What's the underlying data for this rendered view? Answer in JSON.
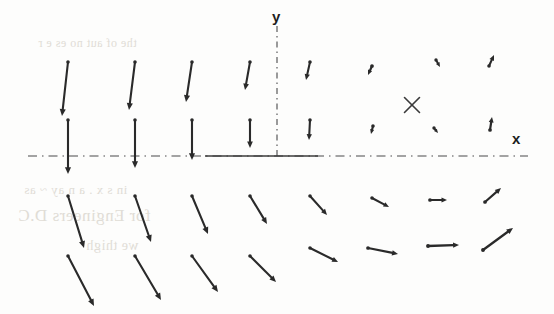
{
  "figure": {
    "kind": "vector-field-plot",
    "width": 554,
    "height": 314,
    "background_color": "#fdfdfc",
    "stroke_color": "#2a2a2a"
  },
  "axes": {
    "x_label": "x",
    "y_label": "y",
    "style": "dash-dot",
    "color": "#4a4a4a",
    "origin_px": {
      "x": 277,
      "y": 156
    },
    "x_axis_y_px": 156,
    "y_axis_x_px": 277,
    "x_axis_start_px": 28,
    "x_axis_end_px": 528,
    "y_axis_top_px": 26,
    "y_axis_bottom_px": 156,
    "x_label_pos_px": {
      "x": 512,
      "y": 144
    },
    "y_label_pos_px": {
      "x": 272,
      "y": 22
    },
    "solid_segment": {
      "x1": 205,
      "x2": 318,
      "y": 156
    }
  },
  "marker": {
    "name": "saddle-point-cross",
    "glyph": "X",
    "pos_px": {
      "x": 412,
      "y": 105
    },
    "size_px": 15,
    "stroke_width": 1.6,
    "color": "#3a3a3a"
  },
  "chart_data": {
    "type": "scatter",
    "title": "",
    "xlabel": "x",
    "ylabel": "y",
    "grid": false,
    "legend": null,
    "columns_px": [
      68,
      135,
      192,
      250,
      310,
      372,
      432,
      492
    ],
    "rows_px": [
      62,
      120,
      196,
      256
    ],
    "vectors": [
      {
        "x": 68,
        "y": 62,
        "dx": -6,
        "dy": 54,
        "head": 7.5,
        "width": 2.1
      },
      {
        "x": 135,
        "y": 62,
        "dx": -6,
        "dy": 48,
        "head": 7.5,
        "width": 2.1
      },
      {
        "x": 192,
        "y": 62,
        "dx": -6,
        "dy": 40,
        "head": 7.5,
        "width": 2.1
      },
      {
        "x": 250,
        "y": 62,
        "dx": -5,
        "dy": 28,
        "head": 7.0,
        "width": 2.1
      },
      {
        "x": 310,
        "y": 62,
        "dx": -4,
        "dy": 18,
        "head": 6.5,
        "width": 2.1
      },
      {
        "x": 372,
        "y": 66,
        "dx": -4,
        "dy": 9,
        "head": 5.5,
        "width": 2.2
      },
      {
        "x": 436,
        "y": 60,
        "dx": 4,
        "dy": 7,
        "head": 5.0,
        "width": 2.0
      },
      {
        "x": 489,
        "y": 66,
        "dx": 5,
        "dy": -11,
        "head": 6.0,
        "width": 2.1
      },
      {
        "x": 68,
        "y": 120,
        "dx": 0,
        "dy": 54,
        "head": 7.5,
        "width": 2.1
      },
      {
        "x": 135,
        "y": 120,
        "dx": 0,
        "dy": 48,
        "head": 7.5,
        "width": 2.1
      },
      {
        "x": 192,
        "y": 120,
        "dx": 0,
        "dy": 40,
        "head": 7.5,
        "width": 2.1
      },
      {
        "x": 250,
        "y": 120,
        "dx": 0,
        "dy": 28,
        "head": 7.0,
        "width": 2.1
      },
      {
        "x": 310,
        "y": 120,
        "dx": -1,
        "dy": 20,
        "head": 6.5,
        "width": 2.1
      },
      {
        "x": 373,
        "y": 126,
        "dx": -2,
        "dy": 8,
        "head": 5.0,
        "width": 2.1
      },
      {
        "x": 434,
        "y": 128,
        "dx": 4,
        "dy": 5,
        "head": 4.5,
        "width": 2.0
      },
      {
        "x": 490,
        "y": 130,
        "dx": 2,
        "dy": -13,
        "head": 6.0,
        "width": 2.2
      },
      {
        "x": 68,
        "y": 196,
        "dx": 16,
        "dy": 52,
        "head": 7.5,
        "width": 2.1
      },
      {
        "x": 135,
        "y": 196,
        "dx": 16,
        "dy": 46,
        "head": 7.5,
        "width": 2.1
      },
      {
        "x": 192,
        "y": 196,
        "dx": 16,
        "dy": 38,
        "head": 7.5,
        "width": 2.1
      },
      {
        "x": 250,
        "y": 196,
        "dx": 17,
        "dy": 28,
        "head": 7.0,
        "width": 2.1
      },
      {
        "x": 310,
        "y": 196,
        "dx": 17,
        "dy": 19,
        "head": 6.5,
        "width": 2.1
      },
      {
        "x": 372,
        "y": 198,
        "dx": 17,
        "dy": 9,
        "head": 6.0,
        "width": 2.1
      },
      {
        "x": 430,
        "y": 200,
        "dx": 17,
        "dy": 0,
        "head": 6.0,
        "width": 2.2
      },
      {
        "x": 485,
        "y": 202,
        "dx": 16,
        "dy": -14,
        "head": 6.5,
        "width": 2.2
      },
      {
        "x": 68,
        "y": 256,
        "dx": 26,
        "dy": 50,
        "head": 7.5,
        "width": 2.1
      },
      {
        "x": 135,
        "y": 256,
        "dx": 26,
        "dy": 44,
        "head": 7.5,
        "width": 2.1
      },
      {
        "x": 192,
        "y": 256,
        "dx": 26,
        "dy": 36,
        "head": 7.5,
        "width": 2.1
      },
      {
        "x": 250,
        "y": 256,
        "dx": 26,
        "dy": 26,
        "head": 7.0,
        "width": 2.1
      },
      {
        "x": 310,
        "y": 248,
        "dx": 28,
        "dy": 14,
        "head": 6.5,
        "width": 2.1
      },
      {
        "x": 368,
        "y": 248,
        "dx": 30,
        "dy": 6,
        "head": 6.5,
        "width": 2.2
      },
      {
        "x": 428,
        "y": 246,
        "dx": 31,
        "dy": -1,
        "head": 6.5,
        "width": 2.3
      },
      {
        "x": 483,
        "y": 250,
        "dx": 30,
        "dy": -22,
        "head": 7.0,
        "width": 2.3
      }
    ]
  },
  "bleed_through": {
    "note": "Faint mirrored show-through of text printed on the reverse side of the scanned page.",
    "color": "#cfcabf",
    "lines": [
      {
        "id": "a",
        "text": "the  of   aut   no  es   e   r"
      },
      {
        "id": "b",
        "text": "in   s  x  .  a   n   ay   ~ as"
      },
      {
        "id": "c",
        "text": "for Engineers D.C"
      },
      {
        "id": "d",
        "text": "we  thigh"
      }
    ]
  }
}
